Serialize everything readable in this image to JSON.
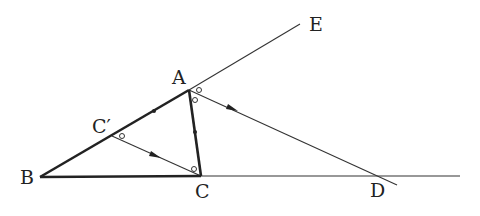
{
  "diagram": {
    "type": "geometry",
    "points": {
      "A": {
        "label": "A",
        "x": 189,
        "y": 90
      },
      "B": {
        "label": "B",
        "x": 40,
        "y": 177
      },
      "C": {
        "label": "C",
        "x": 201,
        "y": 176
      },
      "C_prime": {
        "label": "C′",
        "x": 112,
        "y": 136
      },
      "D": {
        "label": "D",
        "x": 380,
        "y": 176
      },
      "E": {
        "label": "E",
        "x": 300,
        "y": 24
      }
    },
    "labels": {
      "A": "A",
      "B": "B",
      "C": "C",
      "C_prime": "C′",
      "D": "D",
      "E": "E"
    },
    "segments": [
      {
        "from": "B",
        "to": "A",
        "style": "thick"
      },
      {
        "from": "A",
        "to": "C",
        "style": "thick"
      },
      {
        "from": "B",
        "to": "C",
        "style": "thick"
      },
      {
        "from": "A",
        "to": "E",
        "style": "thin"
      },
      {
        "from": "C",
        "to": "D",
        "style": "thin",
        "extends_to_x": 460
      },
      {
        "from": "A",
        "to": "D",
        "style": "thin",
        "arrow": true,
        "extends_past_D": true
      },
      {
        "from": "C_prime",
        "to": "C",
        "style": "thin",
        "arrow": true
      }
    ],
    "markings": {
      "equal_ticks": [
        "C′A",
        "AC"
      ],
      "equal_angles": [
        "∠AC′C",
        "∠ACC′",
        "∠EAD",
        "∠DAC"
      ]
    },
    "colors": {
      "stroke": "#222222",
      "background": "#ffffff"
    }
  }
}
